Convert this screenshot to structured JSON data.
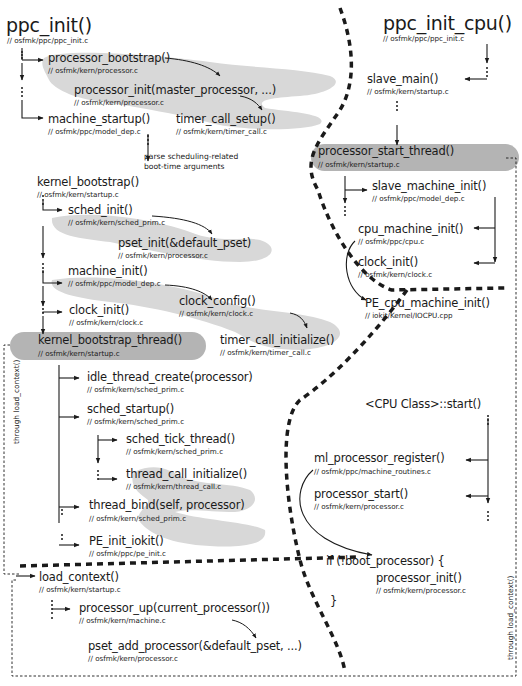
{
  "diagram": {
    "left_title": {
      "name": "ppc_init()",
      "path": "// osfmk/ppc/ppc_init.c"
    },
    "right_title": {
      "name": "ppc_init_cpu()",
      "path": "// osfmk/ppc/ppc_init.c"
    },
    "note": {
      "line1": "parse scheduling-related",
      "line2": "boot-time arguments"
    },
    "side_labels": {
      "left": "through load_context()",
      "right": "through load_context()"
    },
    "cpu_class_start": "<CPU Class>::start()",
    "if_block": {
      "open": "if (!boot_processor) {",
      "close": "}"
    },
    "nodes": [
      {
        "id": "processor_bootstrap",
        "name": "processor_bootstrap()",
        "path": "// osfmk/kern/processor.c"
      },
      {
        "id": "processor_init_master",
        "name": "processor_init(master_processor, ...)",
        "path": "// osfmk/kern/processor.c"
      },
      {
        "id": "machine_startup",
        "name": "machine_startup()",
        "path": "// osfmk/ppc/model_dep.c"
      },
      {
        "id": "timer_call_setup",
        "name": "timer_call_setup()",
        "path": "// osfmk/kern/timer_call.c"
      },
      {
        "id": "kernel_bootstrap",
        "name": "kernel_bootstrap()",
        "path": "// osfmk/kern/startup.c"
      },
      {
        "id": "sched_init",
        "name": "sched_init()",
        "path": "// osfmk/kern/sched_prim.c"
      },
      {
        "id": "pset_init",
        "name": "pset_init(&default_pset)",
        "path": "// osfmk/kern/processor.c"
      },
      {
        "id": "machine_init",
        "name": "machine_init()",
        "path": "// osfmk/ppc/model_dep.c"
      },
      {
        "id": "clock_config",
        "name": "clock_config()",
        "path": "// osfmk/kern/clock.c"
      },
      {
        "id": "clock_init_left",
        "name": "clock_init()",
        "path": "// osfmk/kern/clock.c"
      },
      {
        "id": "timer_call_initialize",
        "name": "timer_call_initialize()",
        "path": "// osfmk/kern/timer_call.c"
      },
      {
        "id": "kernel_bootstrap_thread",
        "name": "kernel_bootstrap_thread()",
        "path": "// osfmk/kern/startup.c"
      },
      {
        "id": "idle_thread_create",
        "name": "idle_thread_create(processor)",
        "path": "// osfmk/kern/sched_prim.c"
      },
      {
        "id": "sched_startup",
        "name": "sched_startup()",
        "path": "// osfmk/kern/sched_prim.c"
      },
      {
        "id": "sched_tick_thread",
        "name": "sched_tick_thread()",
        "path": "// osfmk/kern/sched_prim.c"
      },
      {
        "id": "thread_call_initialize",
        "name": "thread_call_initialize()",
        "path": "// osfmk/kern/thread_call.c"
      },
      {
        "id": "thread_bind",
        "name": "thread_bind(self, processor)",
        "path": "// osfmk/kern/sched_prim.c"
      },
      {
        "id": "PE_init_iokit",
        "name": "PE_init_iokit()",
        "path": "// osfmk/ppc/pe_init.c"
      },
      {
        "id": "load_context",
        "name": "load_context()",
        "path": "// osfmk/kern/startup.c"
      },
      {
        "id": "processor_up",
        "name": "processor_up(current_processor())",
        "path": "// osfmk/kern/machine.c"
      },
      {
        "id": "pset_add_processor",
        "name": "pset_add_processor(&default_pset, ...)",
        "path": "// osfmk/kern/processor.c"
      },
      {
        "id": "slave_main",
        "name": "slave_main()",
        "path": "// osfmk/kern/startup.c"
      },
      {
        "id": "processor_start_thread",
        "name": "processor_start_thread()",
        "path": "// osfmk/kern/startup.c"
      },
      {
        "id": "slave_machine_init",
        "name": "slave_machine_init()",
        "path": "// osfmk/ppc/model_dep.c"
      },
      {
        "id": "cpu_machine_init",
        "name": "cpu_machine_init()",
        "path": "// osfmk/ppc/cpu.c"
      },
      {
        "id": "clock_init_right",
        "name": "clock_init()",
        "path": "// osfmk/kern/clock.c"
      },
      {
        "id": "PE_cpu_machine_init",
        "name": "PE_cpu_machine_init()",
        "path": "// iokit/Kernel/IOCPU.cpp"
      },
      {
        "id": "ml_processor_register",
        "name": "ml_processor_register()",
        "path": "// osfmk/ppc/machine_routines.c"
      },
      {
        "id": "processor_start",
        "name": "processor_start()",
        "path": "// osfmk/kern/processor.c"
      },
      {
        "id": "processor_init_slave",
        "name": "processor_init()",
        "path": "// osfmk/kern/processor.c"
      }
    ],
    "colors": {
      "highlight_blob": "#d8d8d8",
      "thread_pill": "#b4b4b4",
      "line": "#1a1a1a"
    }
  }
}
